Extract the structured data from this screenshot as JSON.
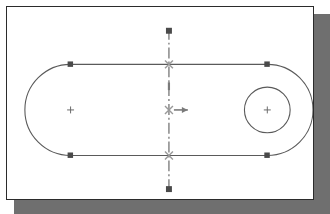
{
  "app": {
    "kind": "cad-drawing-area",
    "title": "AutoCAD drawing area",
    "background_color": "#ffffff",
    "frame_border_color": "#2b2b2b",
    "frame_shadow_color": "#6f6f6f"
  },
  "canvas": {
    "width": 308,
    "height": 194,
    "geometry_color": "#5a5a5a",
    "centerline_color": "#6a6a6a",
    "grip_color": "#4a4a4a",
    "snap_marker_color": "#9a9a9a",
    "tracking_color": "#8a8a8a"
  },
  "drawing": {
    "name": "slot-plate-profile",
    "description": "Obround slot outline with left and right semicircular ends, a small bored circle at the right, a vertical dash-dot centerline through the midpoint, selection grips and an object-snap marker with horizontal tracking vector.",
    "slot": {
      "name": "obround-slot-outline",
      "left_arc_center": {
        "x": 64,
        "y": 104
      },
      "right_arc_center": {
        "x": 262,
        "y": 104
      },
      "radius": 46,
      "top_line": {
        "x1": 64,
        "y1": 58,
        "x2": 262,
        "y2": 58
      },
      "bottom_line": {
        "x1": 64,
        "y1": 150,
        "x2": 262,
        "y2": 150
      }
    },
    "bore_circle": {
      "name": "bore-circle",
      "center": {
        "x": 262,
        "y": 104
      },
      "radius": 23
    },
    "center_marks": [
      {
        "name": "center-mark-left-arc",
        "x": 64,
        "y": 104,
        "size": 7
      },
      {
        "name": "center-mark-right-bore",
        "x": 262,
        "y": 104,
        "size": 7
      }
    ],
    "centerline": {
      "name": "vertical-centerline",
      "x": 163,
      "y_top": 22,
      "y_bottom": 186,
      "style": "dash-dot"
    },
    "grips": [
      {
        "name": "grip-centerline-top",
        "x": 163,
        "y": 24
      },
      {
        "name": "grip-centerline-bottom",
        "x": 163,
        "y": 184
      },
      {
        "name": "grip-top-line-left",
        "x": 64,
        "y": 58
      },
      {
        "name": "grip-top-line-right",
        "x": 262,
        "y": 58
      },
      {
        "name": "grip-bottom-line-left",
        "x": 64,
        "y": 150
      },
      {
        "name": "grip-bottom-line-right",
        "x": 262,
        "y": 150
      }
    ],
    "snap_markers": [
      {
        "name": "snap-marker-top-intersection",
        "x": 163,
        "y": 58
      },
      {
        "name": "snap-marker-center-intersection",
        "x": 163,
        "y": 104
      },
      {
        "name": "snap-marker-bottom-intersection",
        "x": 163,
        "y": 150
      }
    ],
    "tracking_vector": {
      "name": "polar-tracking-arrow",
      "from": {
        "x": 167,
        "y": 104
      },
      "to": {
        "x": 183,
        "y": 104
      },
      "direction": "right"
    },
    "tracking_tick": {
      "name": "tracking-tick-upper",
      "x": 163,
      "y": 80
    }
  }
}
